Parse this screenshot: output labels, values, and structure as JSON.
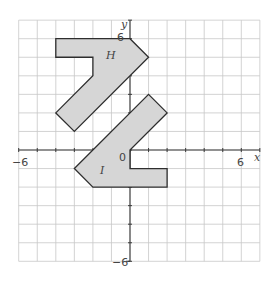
{
  "chart_data": {
    "type": "coordinate-grid",
    "x_range": [
      -6,
      7
    ],
    "y_range": [
      -6,
      7
    ],
    "grid": true,
    "axis_labels": {
      "x": "x",
      "y": "y"
    },
    "tick_labels": {
      "x_min": "−6",
      "x_max": "6",
      "y_min": "−6",
      "y_max": "6",
      "origin": "0"
    },
    "shapes": [
      {
        "name": "H",
        "label": "H",
        "label_pos": [
          -1,
          5
        ],
        "vertices": [
          [
            -4,
            6
          ],
          [
            0,
            6
          ],
          [
            1,
            5
          ],
          [
            -3,
            1
          ],
          [
            -4,
            2
          ],
          [
            -2,
            4
          ],
          [
            -2,
            5
          ],
          [
            -4,
            5
          ]
        ]
      },
      {
        "name": "I",
        "label": "I",
        "label_pos": [
          -1.5,
          -1
        ],
        "vertices": [
          [
            1,
            3
          ],
          [
            2,
            2
          ],
          [
            0,
            0
          ],
          [
            0,
            -1
          ],
          [
            2,
            -1
          ],
          [
            2,
            -2
          ],
          [
            -2,
            -2
          ],
          [
            -3,
            -1
          ]
        ]
      }
    ],
    "colors": {
      "fill": "#d6d6d6",
      "outline": "#2e2e2e",
      "grid": "#c8c8c8",
      "axis": "#3a3a3a"
    }
  }
}
